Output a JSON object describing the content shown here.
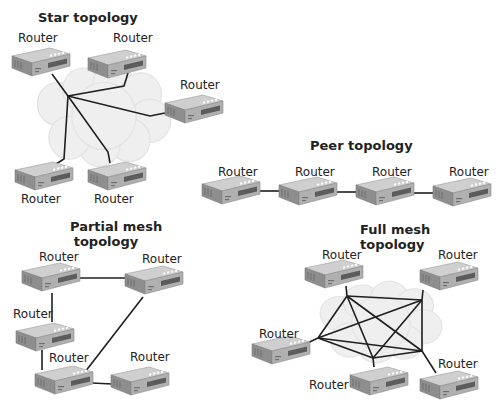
{
  "diagram": {
    "colors": {
      "router_top": "#c8c8c8",
      "router_front": "#a9a9a9",
      "router_side": "#8f8f8f",
      "port": "#ffffff",
      "cloud": "#eeeeee",
      "line": "#1f1f1f"
    },
    "sections": [
      {
        "id": "star",
        "title": "Star topology",
        "routers": [
          {
            "label": "Router"
          },
          {
            "label": "Router"
          },
          {
            "label": "Router"
          },
          {
            "label": "Router"
          },
          {
            "label": "Router"
          }
        ]
      },
      {
        "id": "peer",
        "title": "Peer topology",
        "routers": [
          {
            "label": "Router"
          },
          {
            "label": "Router"
          },
          {
            "label": "Router"
          },
          {
            "label": "Router"
          }
        ]
      },
      {
        "id": "partial",
        "title_line1": "Partial mesh",
        "title_line2": "topology",
        "routers": [
          {
            "label": "Router"
          },
          {
            "label": "Router"
          },
          {
            "label": "Router"
          },
          {
            "label": "Router"
          },
          {
            "label": "Router"
          }
        ]
      },
      {
        "id": "full",
        "title_line1": "Full mesh",
        "title_line2": "topology",
        "routers": [
          {
            "label": "Router"
          },
          {
            "label": "Router"
          },
          {
            "label": "Router"
          },
          {
            "label": "Router"
          },
          {
            "label": "Router"
          }
        ]
      }
    ]
  }
}
